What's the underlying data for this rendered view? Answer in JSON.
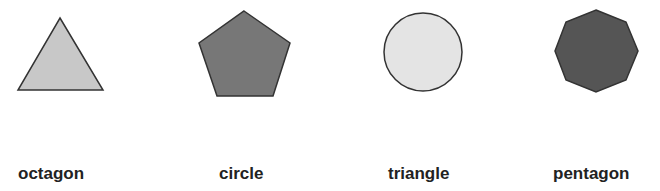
{
  "figure": {
    "shapes": [
      {
        "kind": "triangle",
        "fill": "#c8c8c8",
        "stroke": "#333333"
      },
      {
        "kind": "pentagon",
        "fill": "#777777",
        "stroke": "#333333"
      },
      {
        "kind": "circle",
        "fill": "#e4e4e4",
        "stroke": "#333333"
      },
      {
        "kind": "octagon",
        "fill": "#555555",
        "stroke": "#333333"
      }
    ],
    "labels": [
      {
        "text": "octagon"
      },
      {
        "text": "circle"
      },
      {
        "text": "triangle"
      },
      {
        "text": "pentagon"
      }
    ]
  }
}
